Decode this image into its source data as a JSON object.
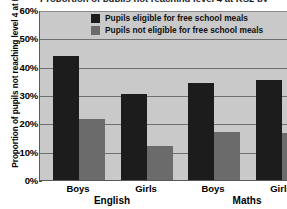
{
  "chart_data": {
    "type": "bar",
    "title": "Proportion of pupils not reaching level 4 at KS2 by free school meal eligibility",
    "xlabel": "",
    "ylabel": "Proportion of pupils not reaching level 4 at KS2",
    "ylim": [
      0,
      60
    ],
    "ytick_labels": [
      "60%",
      "50%",
      "40%",
      "30%",
      "20%",
      "10%",
      "0%"
    ],
    "ytick_values": [
      60,
      50,
      40,
      30,
      20,
      10,
      0
    ],
    "grid": true,
    "legend_position": "top-center",
    "groups": [
      "English",
      "Maths"
    ],
    "categories": [
      "Boys",
      "Girls",
      "Boys",
      "Girls"
    ],
    "series": [
      {
        "name": "Pupils eligible for free school meals",
        "color": "#1c1c1c",
        "values": [
          43.8,
          30.5,
          34.2,
          35.3
        ]
      },
      {
        "name": "Pupils not eligible for free school meals",
        "color": "#6b6b6b",
        "values": [
          21.5,
          12.0,
          17.0,
          16.6
        ]
      }
    ]
  },
  "legend": {
    "items": [
      {
        "label": "Pupils eligible for free school meals",
        "swatch": "eligible"
      },
      {
        "label": "Pupils not eligible for free school meals",
        "swatch": "not-eligible"
      }
    ]
  },
  "axis": {
    "y_title": "Proportion of pupils not reaching level 4 at KS2",
    "ticks": [
      "60%",
      "50%",
      "40%",
      "30%",
      "20%",
      "10%",
      "0%"
    ],
    "group_labels": [
      "English",
      "Maths"
    ],
    "category_labels": [
      "Boys",
      "Girls",
      "Boys",
      "Girls"
    ]
  }
}
